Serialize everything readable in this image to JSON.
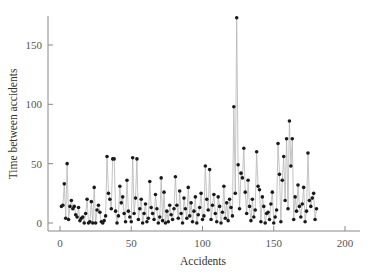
{
  "chart_data": {
    "type": "line",
    "title": "",
    "xlabel": "Accidents",
    "ylabel": "Time between accidents",
    "xlim": [
      -7,
      210
    ],
    "ylim": [
      -7,
      178
    ],
    "xticks": [
      0,
      50,
      100,
      150,
      200
    ],
    "yticks": [
      0,
      50,
      100,
      150
    ],
    "grid": false,
    "legend": null,
    "markers": true,
    "series": [
      {
        "name": "Time between accidents",
        "values": [
          14,
          15,
          33,
          4,
          50,
          3,
          14,
          19,
          12,
          14,
          7,
          5,
          13,
          2,
          4,
          5,
          0,
          8,
          20,
          0,
          1,
          18,
          0,
          30,
          0,
          11,
          15,
          9,
          1,
          0,
          2,
          6,
          56,
          25,
          20,
          12,
          54,
          54,
          10,
          0,
          6,
          31,
          17,
          22,
          8,
          1,
          36,
          10,
          5,
          1,
          55,
          8,
          21,
          54,
          3,
          12,
          20,
          0,
          8,
          16,
          1,
          4,
          35,
          13,
          8,
          3,
          24,
          12,
          0,
          5,
          38,
          2,
          26,
          0,
          10,
          1,
          15,
          7,
          3,
          12,
          39,
          15,
          4,
          27,
          8,
          0,
          21,
          12,
          4,
          30,
          6,
          17,
          1,
          10,
          22,
          0,
          7,
          13,
          25,
          3,
          6,
          48,
          20,
          11,
          45,
          3,
          15,
          24,
          8,
          1,
          22,
          14,
          0,
          9,
          31,
          4,
          17,
          2,
          20,
          13,
          6,
          98,
          25,
          173,
          49,
          12,
          42,
          38,
          63,
          26,
          8,
          36,
          14,
          2,
          20,
          5,
          11,
          60,
          31,
          28,
          1,
          22,
          14,
          0,
          8,
          9,
          3,
          16,
          26,
          0,
          5,
          11,
          67,
          41,
          1,
          36,
          56,
          19,
          71,
          12,
          86,
          48,
          71,
          3,
          22,
          10,
          32,
          14,
          5,
          16,
          30,
          1,
          10,
          59,
          19,
          14,
          21,
          25,
          3,
          12
        ]
      }
    ]
  }
}
